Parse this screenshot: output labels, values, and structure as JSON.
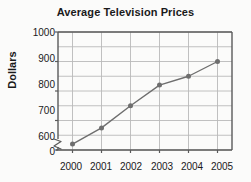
{
  "chart_data": {
    "type": "line",
    "title": "Average Television Prices",
    "xlabel": "",
    "ylabel": "Dollars",
    "categories": [
      "2000",
      "2001",
      "2002",
      "2003",
      "2004",
      "2005"
    ],
    "x": [
      2000,
      2001,
      2002,
      2003,
      2004,
      2005
    ],
    "values": [
      620,
      675,
      750,
      820,
      850,
      900
    ],
    "series": [
      {
        "name": "Average Television Price",
        "values": [
          620,
          675,
          750,
          820,
          850,
          900
        ]
      }
    ],
    "ylim": [
      600,
      1000
    ],
    "ytick_labels": [
      "1000",
      "900",
      "800",
      "700",
      "600",
      "0"
    ],
    "yticks": [
      1000,
      900,
      800,
      700,
      600
    ],
    "zero_tick_label": "0",
    "gridline_step": 50,
    "grid": true,
    "axis_break": true,
    "axis_break_symbol": "zigzag",
    "legend": "none",
    "line_color": "#6e6e6e",
    "marker_color": "#6e6e6e",
    "marker_shape": "circle",
    "grid_color": "#b9b9b9",
    "axis_color": "#5a5a5a",
    "background_color": "#fbfbfa",
    "text_color": "#1a1a1a"
  }
}
